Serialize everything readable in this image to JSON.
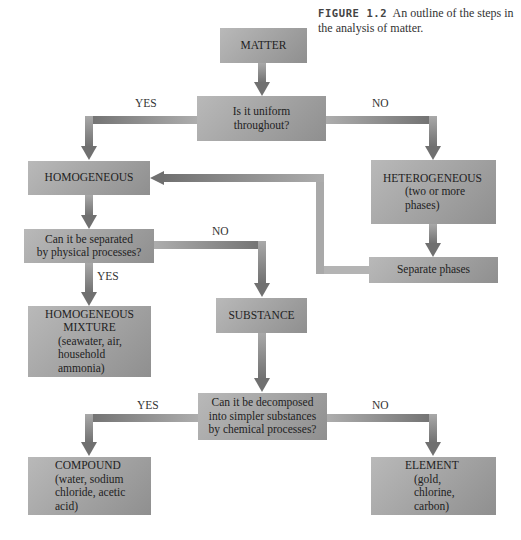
{
  "caption": {
    "figure_label": "FIGURE 1.2",
    "text": "An outline of the steps in the analysis of matter."
  },
  "nodes": {
    "matter": {
      "title": "MATTER"
    },
    "uniform_question": {
      "line1": "Is it uniform",
      "line2": "throughout?"
    },
    "homogeneous": {
      "title": "HOMOGENEOUS"
    },
    "heterogeneous": {
      "title": "HETEROGENEOUS",
      "line1": "(two or more",
      "line2": "phases)"
    },
    "separate_phases": {
      "title": "Separate phases"
    },
    "physical_question": {
      "line1": "Can it be separated",
      "line2": "by physical processes?"
    },
    "homogeneous_mixture": {
      "title1": "HOMOGENEOUS",
      "title2": "MIXTURE",
      "line1": "(seawater, air,",
      "line2": "household",
      "line3": "ammonia)"
    },
    "substance": {
      "title": "SUBSTANCE"
    },
    "chemical_question": {
      "line1": "Can it be decomposed",
      "line2": "into simpler substances",
      "line3": "by chemical processes?"
    },
    "compound": {
      "title": "COMPOUND",
      "line1": "(water, sodium",
      "line2": "chloride, acetic",
      "line3": "acid)"
    },
    "element": {
      "title": "ELEMENT",
      "line1": "(gold,",
      "line2": "chlorine,",
      "line3": "carbon)"
    }
  },
  "edge_labels": {
    "uniform_yes": "YES",
    "uniform_no": "NO",
    "physical_no": "NO",
    "physical_yes": "YES",
    "chemical_yes": "YES",
    "chemical_no": "NO"
  },
  "colors": {
    "box_light": "#b9b9b9",
    "box_dark": "#8f8f8f",
    "arrow_light": "#a8a8a8",
    "arrow_dark": "#6e6e6e"
  }
}
